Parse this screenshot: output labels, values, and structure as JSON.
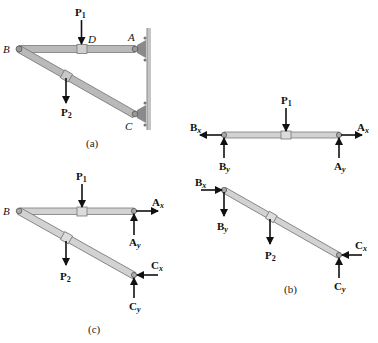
{
  "figure": {
    "panels": [
      {
        "id": "a",
        "caption": "(a)"
      },
      {
        "id": "b",
        "caption": "(b)"
      },
      {
        "id": "c",
        "caption": "(c)"
      }
    ],
    "points": {
      "A": "A",
      "B": "B",
      "C": "C",
      "D": "D"
    },
    "forces": {
      "P1": {
        "main": "P",
        "sub": "1"
      },
      "P2": {
        "main": "P",
        "sub": "2"
      },
      "Ax": {
        "main": "A",
        "sub": "x"
      },
      "Ay": {
        "main": "A",
        "sub": "y"
      },
      "Bx": {
        "main": "B",
        "sub": "x"
      },
      "By": {
        "main": "B",
        "sub": "y"
      },
      "Cx": {
        "main": "C",
        "sub": "x"
      },
      "Cy": {
        "main": "C",
        "sub": "y"
      }
    },
    "colors": {
      "bar_fill_a": "#b9b9b9",
      "bar_fill_bc": "#d2d2d2",
      "bar_edge": "#7a7a7a",
      "wall": "#9a9a9a",
      "arrow": "#111111"
    }
  }
}
